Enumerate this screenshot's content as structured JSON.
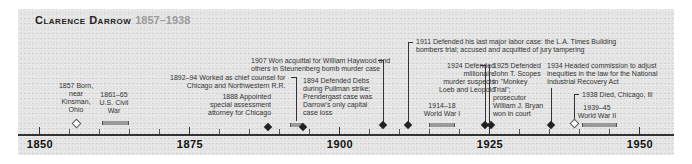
{
  "title": {
    "name": "Clarence Darrow",
    "dates": "1857–1938"
  },
  "axis": {
    "labels": [
      "1850",
      "1875",
      "1900",
      "1925",
      "1950"
    ]
  },
  "events": {
    "born": "1857 Born,\nnear\nKinsman,\nOhio",
    "civil_war": "1861–65\nU.S. Civil\nWar",
    "counsel": "1892–94 Worked as chief counsel for\nChicago and Northwestern R.R.",
    "attorney": "1888 Appointed\nspecial assessment\nattorney for Chicago",
    "debs": "1894 Defended Debs\nduring Pullman strike;\nPrendergast case was\nDarrow's only capital\ncase loss",
    "haywood": "1907 Won acquittal for William Haywood and\nothers in Steunenberg bomb murder case",
    "labor": "1911 Defended his last major labor case: the L.A. Times Building\nbombers trial; accused and acquitted of jury tampering",
    "loeb": "1924 Defended\nmillionaire\nmurder suspects\nLoeb and Leopold",
    "ww1": "1914–18\nWorld War I",
    "scopes": "1925 Defended\nJohn T. Scopes\nin \"Monkey\nTrial\";\nprosecutor\nWilliam J. Bryan\nwon in court",
    "nra": "1934 Headed commission to adjust\ninequities in the law for the National\nIndustrial Recovery Act",
    "died": "1938 Died, Chicago, Ill",
    "ww2": "1939–45\nWorld War II"
  }
}
